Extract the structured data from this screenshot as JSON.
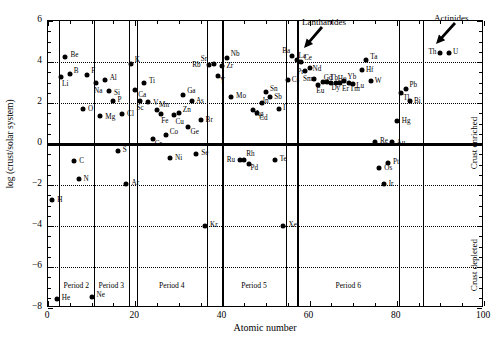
{
  "chart_data": {
    "type": "scatter",
    "title": "",
    "xlabel": "Atomic number",
    "ylabel": "log (crust/solar system)",
    "xlim": [
      0,
      100
    ],
    "ylim": [
      -8,
      6
    ],
    "xticks": [
      0,
      20,
      40,
      60,
      80,
      100
    ],
    "yticks": [
      -8,
      -6,
      -4,
      -2,
      0,
      2,
      4,
      6
    ],
    "grid": "horizontal-dotted",
    "gridlines_y": [
      -6,
      -4,
      -2,
      2,
      4
    ],
    "zero_line_y": 0,
    "legend": "none",
    "points": [
      {
        "label": "H",
        "x": 1,
        "y": -2.75,
        "lx": 5,
        "ly": 1
      },
      {
        "label": "He",
        "x": 2,
        "y": -7.55,
        "lx": 5,
        "ly": 0
      },
      {
        "label": "Li",
        "x": 3,
        "y": 3.25,
        "lx": 1,
        "ly": 8
      },
      {
        "label": "Be",
        "x": 4,
        "y": 4.25,
        "lx": 5,
        "ly": -1
      },
      {
        "label": "B",
        "x": 5,
        "y": 3.42,
        "lx": 4,
        "ly": -2
      },
      {
        "label": "C",
        "x": 6,
        "y": -0.85,
        "lx": 5,
        "ly": 1
      },
      {
        "label": "N",
        "x": 7,
        "y": -1.7,
        "lx": 5,
        "ly": 1
      },
      {
        "label": "O",
        "x": 8,
        "y": 1.7,
        "lx": 5,
        "ly": 1
      },
      {
        "label": "F",
        "x": 9,
        "y": 3.38,
        "lx": 4,
        "ly": -3
      },
      {
        "label": "Ne",
        "x": 10,
        "y": -7.48,
        "lx": 5,
        "ly": -1
      },
      {
        "label": "Na",
        "x": 11,
        "y": 2.97,
        "lx": -2,
        "ly": 9
      },
      {
        "label": "Mg",
        "x": 12,
        "y": 1.35,
        "lx": 5,
        "ly": 2
      },
      {
        "label": "Al",
        "x": 13,
        "y": 3.12,
        "lx": 5,
        "ly": -1
      },
      {
        "label": "Si",
        "x": 14,
        "y": 2.6,
        "lx": 5,
        "ly": 3
      },
      {
        "label": "P",
        "x": 15,
        "y": 2.12,
        "lx": 4,
        "ly": 0
      },
      {
        "label": "S",
        "x": 16,
        "y": -0.35,
        "lx": 5,
        "ly": 0
      },
      {
        "label": "Cl",
        "x": 17,
        "y": 1.47,
        "lx": 5,
        "ly": 1
      },
      {
        "label": "Ar",
        "x": 18,
        "y": -1.97,
        "lx": 5,
        "ly": 0
      },
      {
        "label": "K",
        "x": 19,
        "y": 3.9,
        "lx": 4,
        "ly": -3
      },
      {
        "label": "Ca",
        "x": 20,
        "y": 2.62,
        "lx": 3,
        "ly": 6
      },
      {
        "label": "Sc",
        "x": 21,
        "y": 2.12,
        "lx": -3,
        "ly": 8
      },
      {
        "label": "Ti",
        "x": 22,
        "y": 2.98,
        "lx": 5,
        "ly": -1
      },
      {
        "label": "V",
        "x": 23,
        "y": 2.05,
        "lx": 5,
        "ly": 2
      },
      {
        "label": "Cr",
        "x": 24,
        "y": 0.22,
        "lx": 2,
        "ly": 6
      },
      {
        "label": "Mn",
        "x": 25,
        "y": 1.65,
        "lx": 2,
        "ly": -4
      },
      {
        "label": "Fe",
        "x": 26,
        "y": 1.45,
        "lx": 0,
        "ly": 8
      },
      {
        "label": "Co",
        "x": 27,
        "y": 0.42,
        "lx": 4,
        "ly": -2
      },
      {
        "label": "Ni",
        "x": 28,
        "y": -0.68,
        "lx": 5,
        "ly": 1
      },
      {
        "label": "Cu",
        "x": 29,
        "y": 1.42,
        "lx": 1,
        "ly": 8
      },
      {
        "label": "Zn",
        "x": 30,
        "y": 1.52,
        "lx": 4,
        "ly": -2
      },
      {
        "label": "Ga",
        "x": 31,
        "y": 2.38,
        "lx": 4,
        "ly": -3
      },
      {
        "label": "Ge",
        "x": 32,
        "y": 0.85,
        "lx": 3,
        "ly": 6
      },
      {
        "label": "As",
        "x": 33,
        "y": 2.1,
        "lx": 4,
        "ly": 1
      },
      {
        "label": "Se",
        "x": 34,
        "y": -0.48,
        "lx": 5,
        "ly": 0
      },
      {
        "label": "Br",
        "x": 35,
        "y": 1.18,
        "lx": 5,
        "ly": 1
      },
      {
        "label": "Kr",
        "x": 36,
        "y": -4.0,
        "lx": 5,
        "ly": 0
      },
      {
        "label": "Rb",
        "x": 37,
        "y": 3.85,
        "lx": -17,
        "ly": 1
      },
      {
        "label": "Sr",
        "x": 38,
        "y": 3.9,
        "lx": -13,
        "ly": -4
      },
      {
        "label": "Y",
        "x": 39,
        "y": 3.32,
        "lx": 2,
        "ly": 6
      },
      {
        "label": "Zr",
        "x": 40,
        "y": 3.82,
        "lx": 4,
        "ly": 1
      },
      {
        "label": "Nb",
        "x": 41,
        "y": 4.18,
        "lx": 4,
        "ly": -3
      },
      {
        "label": "Mo",
        "x": 42,
        "y": 2.28,
        "lx": 5,
        "ly": 0
      },
      {
        "label": "Ru",
        "x": 44,
        "y": -0.78,
        "lx": -13,
        "ly": 1
      },
      {
        "label": "Rh",
        "x": 45,
        "y": -0.78,
        "lx": 2,
        "ly": -5
      },
      {
        "label": "Pd",
        "x": 46,
        "y": -0.98,
        "lx": 2,
        "ly": 5
      },
      {
        "label": "Ag",
        "x": 47,
        "y": 1.68,
        "lx": 2,
        "ly": 5
      },
      {
        "label": "Cd",
        "x": 48,
        "y": 1.5,
        "lx": 2,
        "ly": 6
      },
      {
        "label": "In",
        "x": 49,
        "y": 2.02,
        "lx": 1,
        "ly": -1
      },
      {
        "label": "Sn",
        "x": 50,
        "y": 2.55,
        "lx": 4,
        "ly": -2
      },
      {
        "label": "Sb",
        "x": 51,
        "y": 2.3,
        "lx": 4,
        "ly": 1
      },
      {
        "label": "Te",
        "x": 52,
        "y": -0.8,
        "lx": 5,
        "ly": 0
      },
      {
        "label": "I",
        "x": 53,
        "y": 1.7,
        "lx": 4,
        "ly": 0
      },
      {
        "label": "Xe",
        "x": 54,
        "y": -4.0,
        "lx": 5,
        "ly": 0
      },
      {
        "label": "Cs",
        "x": 55,
        "y": 3.12,
        "lx": 4,
        "ly": 1
      },
      {
        "label": "Ba",
        "x": 56,
        "y": 4.3,
        "lx": -10,
        "ly": -4
      },
      {
        "label": "La",
        "x": 57,
        "y": 4.08,
        "lx": 2,
        "ly": -3
      },
      {
        "label": "Ce",
        "x": 58,
        "y": 4.02,
        "lx": 3,
        "ly": -3
      },
      {
        "label": "Pr",
        "x": 59,
        "y": 3.55,
        "lx": -8,
        "ly": 2
      },
      {
        "label": "Nd",
        "x": 60,
        "y": 3.72,
        "lx": 3,
        "ly": 2
      },
      {
        "label": "Sm",
        "x": 61,
        "y": 3.15,
        "lx": -11,
        "ly": 1
      },
      {
        "label": "Eu",
        "x": 62,
        "y": 2.9,
        "lx": -2,
        "ly": 7
      },
      {
        "label": "Gd",
        "x": 63,
        "y": 3.02,
        "lx": 1,
        "ly": -3
      },
      {
        "label": "Tb",
        "x": 64,
        "y": 3.02,
        "lx": 3,
        "ly": -3
      },
      {
        "label": "Dy",
        "x": 65,
        "y": 2.98,
        "lx": 0,
        "ly": 6
      },
      {
        "label": "Ho",
        "x": 66,
        "y": 3.0,
        "lx": 2,
        "ly": -3
      },
      {
        "label": "Er",
        "x": 67,
        "y": 3.0,
        "lx": 2,
        "ly": 7
      },
      {
        "label": "Yb",
        "x": 68,
        "y": 3.05,
        "lx": 3,
        "ly": -3
      },
      {
        "label": "Tm",
        "x": 69,
        "y": 2.98,
        "lx": 1,
        "ly": 7
      },
      {
        "label": "Lu",
        "x": 70,
        "y": 2.92,
        "lx": 3,
        "ly": 3
      },
      {
        "label": "Hf",
        "x": 72,
        "y": 3.62,
        "lx": 4,
        "ly": 1
      },
      {
        "label": "Ta",
        "x": 73,
        "y": 4.08,
        "lx": 4,
        "ly": -2
      },
      {
        "label": "W",
        "x": 74,
        "y": 3.05,
        "lx": 4,
        "ly": 1
      },
      {
        "label": "Re",
        "x": 75,
        "y": 0.08,
        "lx": 5,
        "ly": 0
      },
      {
        "label": "Os",
        "x": 76,
        "y": -1.18,
        "lx": 5,
        "ly": 1
      },
      {
        "label": "Ir",
        "x": 77,
        "y": -1.95,
        "lx": 5,
        "ly": 1
      },
      {
        "label": "Pt",
        "x": 78,
        "y": -0.95,
        "lx": 5,
        "ly": 0
      },
      {
        "label": "Au",
        "x": 79,
        "y": 0.08,
        "lx": 4,
        "ly": 2
      },
      {
        "label": "Hg",
        "x": 80,
        "y": 1.12,
        "lx": 5,
        "ly": 1
      },
      {
        "label": "Tl",
        "x": 81,
        "y": 2.48,
        "lx": 2,
        "ly": 6
      },
      {
        "label": "Pb",
        "x": 82,
        "y": 2.68,
        "lx": 4,
        "ly": -3
      },
      {
        "label": "Bi",
        "x": 83,
        "y": 2.12,
        "lx": 4,
        "ly": 1
      },
      {
        "label": "Th",
        "x": 90,
        "y": 4.42,
        "lx": -12,
        "ly": 0
      },
      {
        "label": "U",
        "x": 92,
        "y": 4.42,
        "lx": 4,
        "ly": 0
      }
    ],
    "period_dividers_x": [
      2.5,
      10.5,
      18.5,
      20.3,
      36.5,
      40.0,
      54.5,
      57.2,
      80.5,
      86.0
    ],
    "period_bands": [
      {
        "label": "Period 2",
        "from": 2.5,
        "to": 10.5
      },
      {
        "label": "Period 3",
        "from": 10.5,
        "to": 18.5
      },
      {
        "label": "Period 4",
        "from": 20.3,
        "to": 36.5
      },
      {
        "label": "Period 5",
        "from": 40.0,
        "to": 54.5
      },
      {
        "label": "Period 6",
        "from": 57.2,
        "to": 80.5
      }
    ],
    "period_band_label_y": 260,
    "annotations": [
      {
        "name": "lanthanides",
        "text": "Lanthanides",
        "tx": 302,
        "ty": 17,
        "ax1": 322,
        "ay1": 27,
        "ax2": 304,
        "ay2": 48
      },
      {
        "name": "actinides",
        "text": "Actinides",
        "tx": 434,
        "ty": 13,
        "ax1": 455,
        "ay1": 23,
        "ax2": 436,
        "ay2": 44
      }
    ],
    "side_labels": [
      {
        "name": "crust-enriched",
        "text": "Crust enriched",
        "top": 60,
        "height": 125
      },
      {
        "name": "crust-depleted",
        "text": "Crust depleted",
        "top": 185,
        "height": 120
      }
    ]
  }
}
